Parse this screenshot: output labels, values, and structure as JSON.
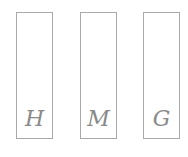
{
  "boxes": [
    {
      "letter": "H"
    },
    {
      "letter": "M"
    },
    {
      "letter": "G"
    }
  ],
  "colors": {
    "border": "#a9a9a9",
    "letter": "#8a8a8a",
    "background": "#ffffff"
  }
}
